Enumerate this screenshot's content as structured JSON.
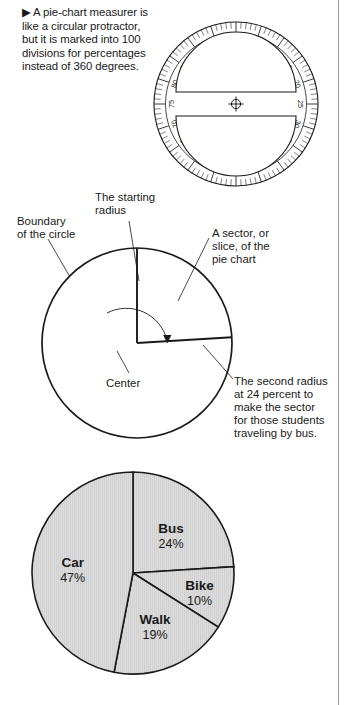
{
  "page": {
    "background": "#ffffff",
    "ink": "#1a1a1a",
    "rule_color": "#9a9a9a"
  },
  "caption": {
    "marker": "▶",
    "text": "A pie-chart measurer is like a circular protractor, but it is marked into 100 divisions for percentages instead of 360 degrees."
  },
  "protractor": {
    "name": "pie-chart measurer",
    "divisions": 100,
    "major_step": 5,
    "tick_labels": [
      "0",
      "5",
      "10",
      "15",
      "20",
      "25",
      "30",
      "35",
      "40",
      "45",
      "50",
      "55",
      "60",
      "65",
      "70",
      "75",
      "80",
      "85",
      "90",
      "95"
    ],
    "center_marker": "crosshair",
    "cutout_shape": "two half-disc windows",
    "outline_color": "#1a1a1a"
  },
  "circle_diagram": {
    "labels": {
      "boundary": "Boundary\nof the circle",
      "boundary_line1": "Boundary",
      "boundary_line2": "of the circle",
      "starting_radius_line1": "The starting",
      "starting_radius_line2": "radius",
      "sector_line1": "A sector, or",
      "sector_line2": "slice, of the",
      "sector_line3": "pie chart",
      "center": "Center",
      "second_radius_line1": "The second radius",
      "second_radius_line2": "at 24 percent to",
      "second_radius_line3": "make the sector",
      "second_radius_line4": "for those students",
      "second_radius_line5": "traveling by bus."
    },
    "sector_percent": 24,
    "arrow": "clockwise sweep arrow"
  },
  "chart_data": {
    "type": "pie",
    "title": "",
    "categories": [
      "Bus",
      "Bike",
      "Walk",
      "Car"
    ],
    "values": [
      24,
      10,
      19,
      47
    ],
    "value_labels": [
      "24%",
      "10%",
      "19%",
      "47%"
    ],
    "unit": "%",
    "start_angle_deg": 0,
    "direction": "clockwise",
    "fill": "#d9d9d9",
    "stroke": "#1a1a1a",
    "legend": "none (labels inside slices)",
    "slices": [
      {
        "name": "Bus",
        "value": 24,
        "label": "24%"
      },
      {
        "name": "Bike",
        "value": 10,
        "label": "10%"
      },
      {
        "name": "Walk",
        "value": 19,
        "label": "19%"
      },
      {
        "name": "Car",
        "value": 47,
        "label": "47%"
      }
    ]
  }
}
